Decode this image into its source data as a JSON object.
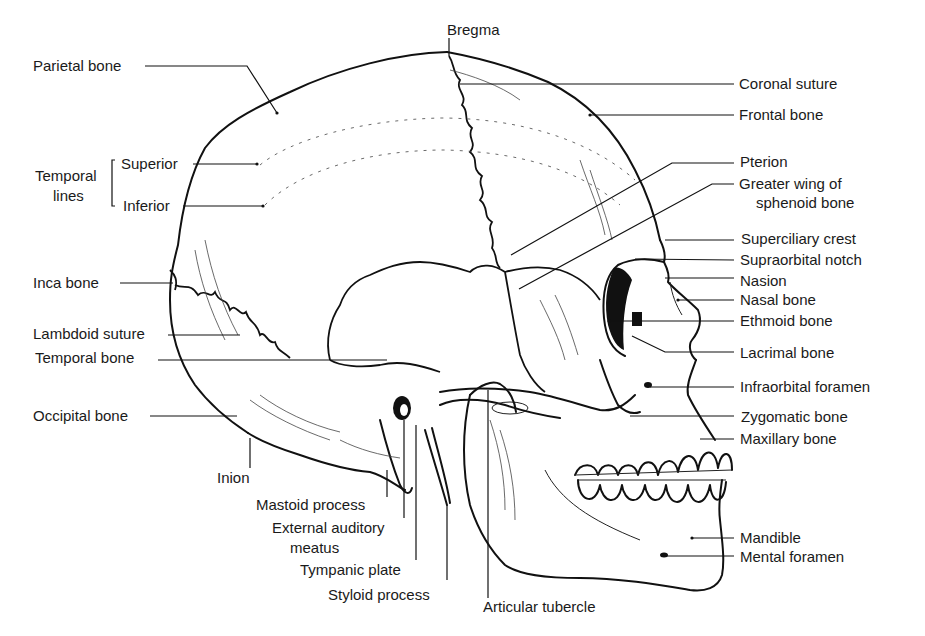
{
  "figure": {
    "type": "anatomical illustration"
  },
  "labels": {
    "bregma": "Bregma",
    "parietal_bone": "Parietal bone",
    "coronal_suture": "Coronal suture",
    "frontal_bone": "Frontal bone",
    "temporal_lines": [
      "Temporal",
      "lines"
    ],
    "superior": "Superior",
    "inferior": "Inferior",
    "pterion": "Pterion",
    "greater_wing": [
      "Greater wing of",
      "sphenoid bone"
    ],
    "superciliary_crest": "Superciliary crest",
    "supraorbital_notch": "Supraorbital notch",
    "nasion": "Nasion",
    "nasal_bone": "Nasal bone",
    "inca_bone": "Inca bone",
    "ethmoid_bone": "Ethmoid bone",
    "lambdoid_suture": "Lambdoid suture",
    "temporal_bone": "Temporal bone",
    "lacrimal_bone": "Lacrimal bone",
    "infraorbital_foramen": "Infraorbital foramen",
    "occipital_bone": "Occipital bone",
    "zygomatic_bone": "Zygomatic bone",
    "maxillary_bone": "Maxillary bone",
    "inion": "Inion",
    "mastoid_process": "Mastoid process",
    "external_auditory_meatus": [
      "External auditory",
      "meatus"
    ],
    "tympanic_plate": "Tympanic plate",
    "styloid_process": "Styloid process",
    "articular_tubercle": "Articular tubercle",
    "mandible": "Mandible",
    "mental_foramen": "Mental foramen"
  }
}
